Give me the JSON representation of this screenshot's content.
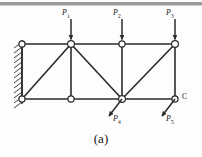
{
  "figure": {
    "caption": "(a)",
    "type": "statics-truss-free-body-diagram",
    "background_color": "#fdfdfd",
    "line_color": "#2b2b2b"
  },
  "labels": {
    "load_1": {
      "symbol": "P",
      "subscript": "1",
      "x": 63,
      "y": 12
    },
    "load_2": {
      "symbol": "P",
      "subscript": "2",
      "x": 115,
      "y": 12
    },
    "load_3": {
      "symbol": "P",
      "subscript": "3",
      "x": 168,
      "y": 12
    },
    "load_4": {
      "symbol": "P",
      "subscript": "4",
      "x": 114,
      "y": 119
    },
    "load_5": {
      "symbol": "P",
      "subscript": "5",
      "x": 166,
      "y": 119
    },
    "joint_c": {
      "text": "C",
      "x": 184,
      "y": 95
    }
  },
  "geometry": {
    "wall_x": 22,
    "top_chord_y": 44,
    "bottom_chord_y": 99,
    "joints": [
      {
        "name": "top-left",
        "x": 22,
        "y": 44
      },
      {
        "name": "top-panel-1",
        "x": 71,
        "y": 44
      },
      {
        "name": "top-panel-2",
        "x": 122,
        "y": 44
      },
      {
        "name": "top-right",
        "x": 175,
        "y": 44
      },
      {
        "name": "bottom-left",
        "x": 22,
        "y": 99
      },
      {
        "name": "bottom-panel-1",
        "x": 71,
        "y": 99
      },
      {
        "name": "bottom-panel-2",
        "x": 122,
        "y": 99
      },
      {
        "name": "bottom-right",
        "x": 175,
        "y": 99
      }
    ],
    "members": [
      {
        "name": "top-chord",
        "from": [
          22,
          44
        ],
        "to": [
          175,
          44
        ]
      },
      {
        "name": "bottom-chord",
        "from": [
          22,
          99
        ],
        "to": [
          175,
          99
        ]
      },
      {
        "name": "vertical-left",
        "from": [
          22,
          44
        ],
        "to": [
          22,
          99
        ]
      },
      {
        "name": "vertical-mid-1",
        "from": [
          71,
          44
        ],
        "to": [
          71,
          99
        ]
      },
      {
        "name": "vertical-mid-2",
        "from": [
          122,
          44
        ],
        "to": [
          122,
          99
        ]
      },
      {
        "name": "vertical-right",
        "from": [
          175,
          44
        ],
        "to": [
          175,
          99
        ]
      },
      {
        "name": "diagonal-1",
        "from": [
          22,
          99
        ],
        "to": [
          71,
          44
        ]
      },
      {
        "name": "diagonal-2",
        "from": [
          71,
          44
        ],
        "to": [
          122,
          99
        ]
      },
      {
        "name": "diagonal-3",
        "from": [
          122,
          99
        ],
        "to": [
          175,
          44
        ]
      }
    ],
    "arrows": [
      {
        "name": "P1",
        "from": [
          71,
          18
        ],
        "to": [
          71,
          41
        ],
        "direction": "down"
      },
      {
        "name": "P2",
        "from": [
          122,
          18
        ],
        "to": [
          122,
          41
        ],
        "direction": "down"
      },
      {
        "name": "P3",
        "from": [
          175,
          18
        ],
        "to": [
          175,
          41
        ],
        "direction": "down"
      },
      {
        "name": "P4",
        "from": [
          122,
          99
        ],
        "to": [
          108,
          118
        ],
        "direction": "down-left"
      },
      {
        "name": "P5",
        "from": [
          175,
          99
        ],
        "to": [
          161,
          118
        ],
        "direction": "down-left"
      }
    ]
  }
}
